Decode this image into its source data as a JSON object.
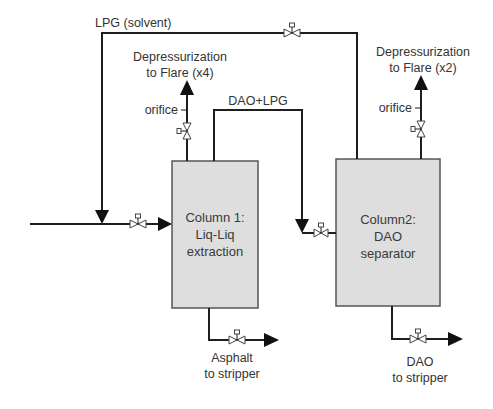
{
  "diagram": {
    "type": "process-flow",
    "colors": {
      "line": "#1e1e1e",
      "vessel_fill": "#dedede",
      "vessel_border": "#555555",
      "text": "#333333"
    },
    "streams": {
      "solvent": "LPG (solvent)",
      "dao_lpg": "DAO+LPG",
      "flare_left_line1": "Depressurization",
      "flare_left_line2": "to Flare (x4)",
      "flare_right_line1": "Depressurization",
      "flare_right_line2": "to Flare  (x2)",
      "orifice_left": "orifice",
      "orifice_right": "orifice",
      "asphalt_line1": "Asphalt",
      "asphalt_line2": "to stripper",
      "dao_line1": "DAO",
      "dao_line2": "to stripper"
    },
    "columns": [
      {
        "line1": "Column 1:",
        "line2": "Liq-Liq",
        "line3": "extraction"
      },
      {
        "line1": "Column2:",
        "line2": "DAO",
        "line3": "separator"
      }
    ],
    "valves": [
      "lpg-solvent-valve",
      "feed-valve",
      "column1-flare-valve",
      "dao-lpg-valve",
      "column2-flare-valve",
      "asphalt-valve",
      "dao-valve"
    ]
  }
}
